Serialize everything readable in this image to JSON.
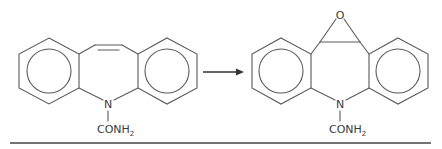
{
  "diagram": {
    "type": "chemical-reaction-scheme",
    "reactant": {
      "name": "carbamazepine",
      "substituent_label": "CONH",
      "substituent_subscript": "2",
      "heteroatom_label": "N"
    },
    "product": {
      "name": "carbamazepine-10,11-epoxide",
      "substituent_label": "CONH",
      "substituent_subscript": "2",
      "heteroatom_label": "N",
      "epoxide_oxygen_label": "O"
    },
    "arrow": "reaction-arrow-right",
    "colors": {
      "bonds": "#5a5a5a",
      "text": "#3a3a3a",
      "rule": "#444444",
      "background": "#ffffff"
    }
  }
}
